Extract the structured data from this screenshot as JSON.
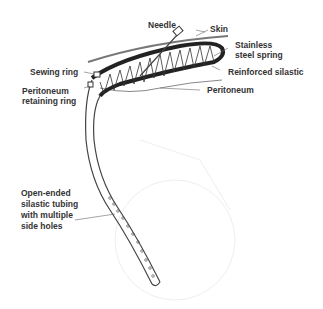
{
  "labels": {
    "needle": "Needle",
    "skin": "Skin",
    "stainless_l1": "Stainless",
    "stainless_l2": "steel spring",
    "sewing_ring": "Sewing ring",
    "reinforced": "Reinforced silastic",
    "peritoneum_ret_l1": "Peritoneum",
    "peritoneum_ret_l2": "retaining ring",
    "peritoneum": "Peritoneum",
    "tubing_l1": "Open-ended",
    "tubing_l2": "silastic tubing",
    "tubing_l3": "with multiple",
    "tubing_l4": "side holes"
  }
}
